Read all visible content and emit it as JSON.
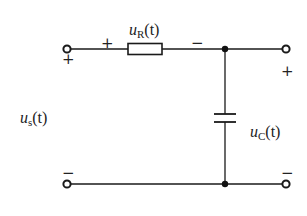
{
  "diagram": {
    "type": "RC series circuit",
    "components": {
      "resistor": {
        "voltage_label": {
          "var": "u",
          "sub": "R",
          "arg": "(t)"
        },
        "polarity": {
          "plus": "+",
          "minus": "−"
        }
      },
      "capacitor": {
        "voltage_label": {
          "var": "u",
          "sub": "C",
          "arg": "(t)"
        }
      },
      "source": {
        "voltage_label": {
          "var": "u",
          "sub": "s",
          "arg": "(t)"
        }
      }
    },
    "terminals": {
      "input_top_polarity": "+",
      "input_bottom_polarity": "−",
      "output_top_polarity": "+",
      "output_bottom_polarity": "−"
    },
    "colors": {
      "line": "#1a1a1a",
      "background": "#ffffff"
    }
  }
}
